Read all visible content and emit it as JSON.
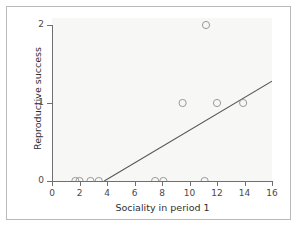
{
  "chart_data": {
    "type": "scatter",
    "title": "",
    "subtitle": "",
    "xlabel": "Sociality in period 1",
    "ylabel": "Reproductive success",
    "xlim": [
      0,
      16
    ],
    "ylim": [
      0,
      2
    ],
    "xticks": [
      0,
      2,
      4,
      6,
      8,
      10,
      12,
      14,
      16
    ],
    "xticklabels": [
      "0",
      "2",
      "4",
      "6",
      "8",
      "10",
      "12",
      "14",
      "16"
    ],
    "yticks": [
      0,
      1,
      2
    ],
    "yticklabels": [
      "0",
      "1",
      "2"
    ],
    "grid": false,
    "legend": false,
    "legend_position": "none",
    "series": [
      {
        "name": "Individuals",
        "marker": "open-circle",
        "color": "#9a9a9a",
        "points": [
          {
            "x": 1.7,
            "y": 0
          },
          {
            "x": 2.0,
            "y": 0
          },
          {
            "x": 2.8,
            "y": 0
          },
          {
            "x": 3.4,
            "y": 0
          },
          {
            "x": 7.5,
            "y": 0
          },
          {
            "x": 8.1,
            "y": 0
          },
          {
            "x": 11.1,
            "y": 0
          },
          {
            "x": 9.5,
            "y": 1
          },
          {
            "x": 12.0,
            "y": 1
          },
          {
            "x": 13.9,
            "y": 1
          },
          {
            "x": 11.2,
            "y": 2
          }
        ]
      }
    ],
    "fit_line": {
      "name": "regression line",
      "color": "#555555",
      "x_start": 3.8,
      "y_start": 0.0,
      "x_end": 16.0,
      "y_end": 1.28
    },
    "panel_color": "#f7f7f5",
    "axis_color": "#6f6f6f",
    "frame_color": "#b9b9b9"
  }
}
